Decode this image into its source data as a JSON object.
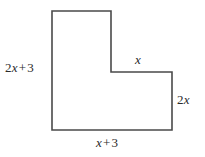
{
  "figure": {
    "name": "L-shaped polygon with algebraic side lengths",
    "background_color": "#ffffff",
    "stroke_color": "#4a4a4a",
    "stroke_width": 1.6,
    "fill_color": "#ffffff",
    "vertices": [
      {
        "x": 52,
        "y": 11
      },
      {
        "x": 111,
        "y": 11
      },
      {
        "x": 111,
        "y": 72
      },
      {
        "x": 172,
        "y": 72
      },
      {
        "x": 172,
        "y": 130
      },
      {
        "x": 52,
        "y": 130
      }
    ],
    "labels": {
      "left": {
        "coef": "2",
        "var": "x",
        "op": "+",
        "const": "3",
        "full": "2x + 3"
      },
      "notch_top": {
        "coef": "",
        "var": "x",
        "op": "",
        "const": "",
        "full": "x"
      },
      "right": {
        "coef": "2",
        "var": "x",
        "op": "",
        "const": "",
        "full": "2x"
      },
      "bottom": {
        "coef": "",
        "var": "x",
        "op": "+",
        "const": "3",
        "full": "x + 3"
      }
    }
  }
}
